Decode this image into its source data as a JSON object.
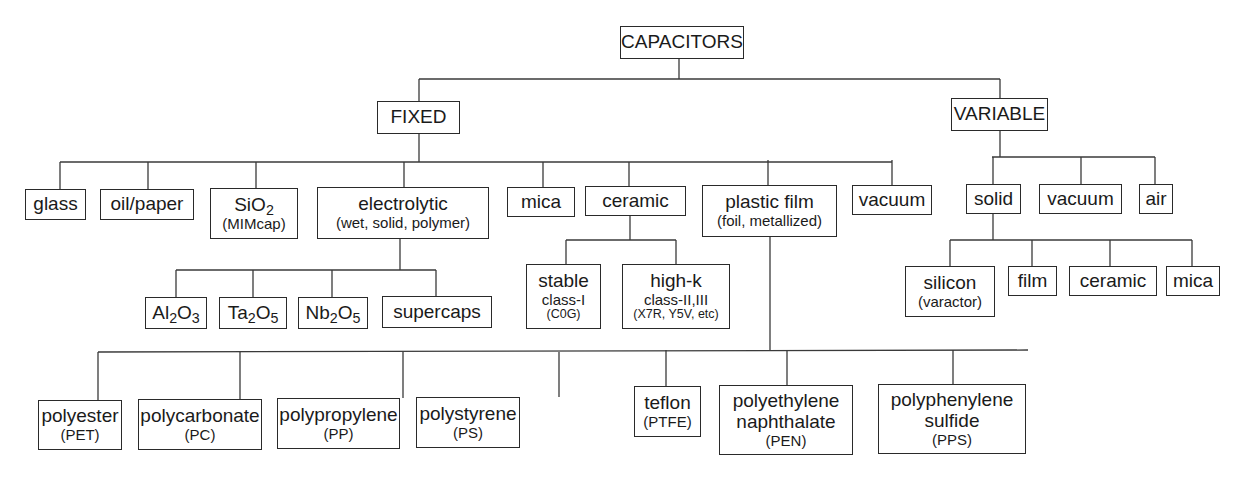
{
  "diagram": {
    "title": "CAPACITORS",
    "root": {
      "label": "CAPACITORS"
    },
    "fixed": {
      "label": "FIXED",
      "children": [
        {
          "label": "glass"
        },
        {
          "label": "oil/paper"
        },
        {
          "label_main": "SiO",
          "label_sub": "2",
          "label_note": "(MIMcap)"
        },
        {
          "label": "electrolytic",
          "label_note": "(wet, solid, polymer)"
        },
        {
          "label": "mica"
        },
        {
          "label": "ceramic"
        },
        {
          "label": "plastic film",
          "label_note": "(foil, metallized)"
        },
        {
          "label": "vacuum"
        }
      ],
      "electrolytic_children": [
        {
          "parts": [
            "Al",
            "2",
            "O",
            "3"
          ]
        },
        {
          "parts": [
            "Ta",
            "2",
            "O",
            "5"
          ]
        },
        {
          "parts": [
            "Nb",
            "2",
            "O",
            "5"
          ]
        },
        {
          "label": "supercaps"
        }
      ],
      "ceramic_children": [
        {
          "label": "stable",
          "line2": "class-I",
          "line3": "(C0G)"
        },
        {
          "label": "high-k",
          "line2": "class-II,III",
          "line3": "(X7R, Y5V, etc)"
        }
      ],
      "plastic_film_children": [
        {
          "label": "polyester",
          "abbr": "(PET)"
        },
        {
          "label": "polycarbonate",
          "abbr": "(PC)"
        },
        {
          "label": "polypropylene",
          "abbr": "(PP)"
        },
        {
          "label": "polystyrene",
          "abbr": "(PS)"
        },
        {
          "label": "teflon",
          "abbr": "(PTFE)"
        },
        {
          "label": "polyethylene",
          "label2": "naphthalate",
          "abbr": "(PEN)"
        },
        {
          "label": "polyphenylene",
          "label2": "sulfide",
          "abbr": "(PPS)"
        }
      ]
    },
    "variable": {
      "label": "VARIABLE",
      "children": [
        {
          "label": "solid"
        },
        {
          "label": "vacuum"
        },
        {
          "label": "air"
        }
      ],
      "solid_children": [
        {
          "label": "silicon",
          "label_note": "(varactor)"
        },
        {
          "label": "film"
        },
        {
          "label": "ceramic"
        },
        {
          "label": "mica"
        }
      ]
    }
  }
}
